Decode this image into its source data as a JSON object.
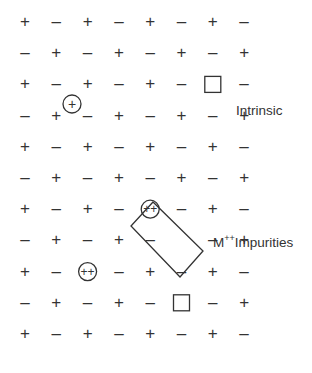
{
  "diagram": {
    "grid": {
      "rows": 11,
      "cols": 8,
      "x0": 25,
      "dx": 31.3,
      "y0": 22,
      "dy": 31.2,
      "pattern": "alternating + / − starting with + at top-left"
    },
    "vacancies": [
      {
        "row": 2,
        "col": 6,
        "symbol": "square"
      },
      {
        "row": 7,
        "col": 5,
        "symbol": "empty-in-rect"
      },
      {
        "row": 9,
        "col": 5,
        "symbol": "square"
      }
    ],
    "impurities": [
      {
        "row": 6,
        "col": 4,
        "symbol": "++",
        "circled": true
      },
      {
        "row": 8,
        "col": 2,
        "symbol": "++",
        "circled": true
      }
    ],
    "interstitials": [
      {
        "x": 72,
        "y": 104,
        "symbol": "+",
        "circled": true
      }
    ],
    "labels": {
      "intrinsic": "Intrinsic",
      "impurities_prefix": "M",
      "impurities_sup": "++",
      "impurities_suffix": "Impurities"
    },
    "colors": {
      "ink": "#333333",
      "background": "#ffffff"
    }
  }
}
